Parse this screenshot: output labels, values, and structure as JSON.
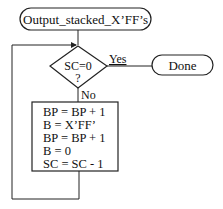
{
  "diagram": {
    "type": "flowchart",
    "start_terminator": {
      "label": "Output_stacked_X’FF’s"
    },
    "decision": {
      "line1": "SC=0",
      "line2": "?",
      "yes_label": "Yes",
      "no_label": "No"
    },
    "end_terminator": {
      "label": "Done"
    },
    "process_box": {
      "lines": [
        "BP = BP + 1",
        "B = X’FF’",
        "BP = BP + 1",
        "B = 0",
        "SC = SC - 1"
      ]
    },
    "stroke_color": "#222222"
  }
}
